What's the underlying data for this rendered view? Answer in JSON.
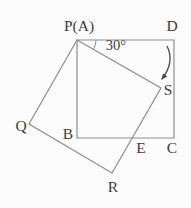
{
  "figure": {
    "angle_label": "30°",
    "labels": {
      "P": "P(A)",
      "D": "D",
      "S": "S",
      "Q": "Q",
      "B": "B",
      "E": "E",
      "C": "C",
      "R": "R"
    },
    "colors": {
      "background": "#fcfcfc",
      "line": "#8d8d8d",
      "arrow": "#4a4a4a",
      "text": "#3c3c3c"
    }
  }
}
